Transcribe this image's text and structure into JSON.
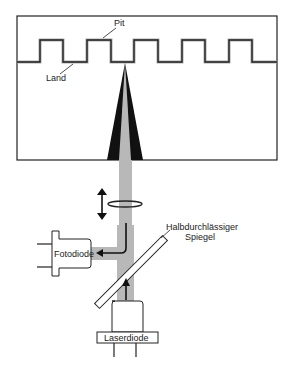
{
  "diagram": {
    "labels": {
      "pit": "Pit",
      "land": "Land",
      "mirror_line1": "Halbdurchlässiger",
      "mirror_line2": "Spiegel",
      "photodiode": "Fotodiode",
      "laserdiode": "Laserdiode"
    },
    "colors": {
      "line": "#222222",
      "beam": "#b8b8b8",
      "cone": "#111111",
      "background": "#ffffff"
    }
  }
}
